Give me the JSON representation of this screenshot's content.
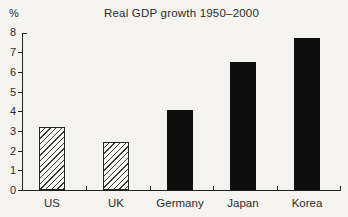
{
  "chart_data": {
    "type": "bar",
    "title": "Real GDP growth 1950–2000",
    "ylabel": "%",
    "xlabel": "",
    "categories": [
      "US",
      "UK",
      "Germany",
      "Japan",
      "Korea"
    ],
    "values": [
      3.2,
      2.45,
      4.05,
      6.5,
      7.7
    ],
    "bar_styles": [
      "hatched",
      "hatched",
      "solid",
      "solid",
      "solid"
    ],
    "ylim": [
      0,
      8
    ],
    "yticks": [
      0,
      1,
      2,
      3,
      4,
      5,
      6,
      7,
      8
    ],
    "grid": false,
    "legend_position": "none",
    "colors": {
      "background": "#f4f3ef",
      "axis": "#222222",
      "text": "#2b2b2b",
      "solid_bar": "#0e0e0e",
      "hatch_line": "#3a3a3a",
      "hatch_background": "#fbfaf7"
    }
  }
}
